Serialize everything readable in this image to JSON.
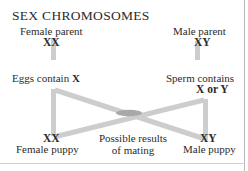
{
  "diagram": {
    "title": "SEX CHROMOSOMES",
    "female_parent": {
      "label": "Female parent",
      "genotype": "XX"
    },
    "male_parent": {
      "label": "Male parent",
      "genotype": "XY"
    },
    "gametes": {
      "egg_text": "Eggs contain ",
      "egg_allele": "X",
      "sperm_text": "Sperm contains",
      "sperm_allele": "X or Y"
    },
    "offspring": {
      "female_puppy": {
        "genotype": "XX",
        "label": "Female puppy"
      },
      "male_puppy": {
        "genotype": "XY",
        "label": "Male puppy"
      },
      "results_line1": "Possible results",
      "results_line2": "of mating"
    },
    "colors": {
      "connector": "#cdcdcd",
      "connector_overlap": "#a8a8a8",
      "text": "#2b2b2b",
      "frame": "#b9b9b9",
      "background": "#ffffff"
    }
  }
}
